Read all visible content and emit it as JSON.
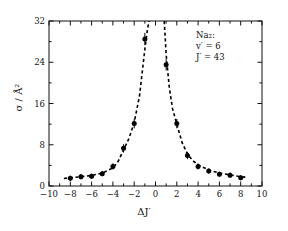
{
  "figure": {
    "annotation": {
      "species": "Na₂:",
      "vibrational": "v′ = 6",
      "rotational": "J′ = 43"
    },
    "axis_titles": {
      "x": "ΔJ′",
      "y": "σ / Å²"
    }
  },
  "chart_data": {
    "type": "scatter",
    "title": "",
    "subtitle": "",
    "xlabel": "ΔJ′",
    "ylabel": "σ / Å²",
    "xlim": [
      -10,
      10
    ],
    "ylim": [
      0,
      32
    ],
    "xticks": [
      -10,
      -8,
      -6,
      -4,
      -2,
      0,
      2,
      4,
      6,
      8,
      10
    ],
    "xtick_labels": [
      "-10",
      "-8",
      "-6",
      "-4",
      "-2",
      "0",
      "2",
      "4",
      "6",
      "8",
      "10"
    ],
    "yticks": [
      0,
      8,
      16,
      24,
      32
    ],
    "ytick_labels": [
      "0",
      "8",
      "16",
      "24",
      "32"
    ],
    "minor_xticks": [
      -9,
      -7,
      -5,
      -3,
      -1,
      1,
      3,
      5,
      7,
      9
    ],
    "minor_yticks": [
      4,
      12,
      20,
      28
    ],
    "grid": false,
    "legend": null,
    "ticks_direction": "in",
    "frame": "box",
    "marker": "filled-circle",
    "marker_color": "#000000",
    "errorbars": true,
    "series": [
      {
        "name": "cross section",
        "x": [
          -8,
          -7,
          -6,
          -5,
          -4,
          -3,
          -2,
          -1,
          1,
          2,
          3,
          4,
          5,
          6,
          7,
          8
        ],
        "y": [
          1.5,
          1.8,
          1.9,
          2.4,
          3.8,
          7.3,
          12.1,
          28.5,
          23.5,
          12.1,
          5.9,
          3.8,
          2.9,
          2.3,
          2.1,
          1.6
        ],
        "yerr": [
          0.5,
          0.5,
          0.5,
          0.5,
          0.6,
          0.8,
          0.9,
          1.2,
          1.1,
          0.9,
          0.7,
          0.6,
          0.5,
          0.5,
          0.5,
          0.5
        ]
      }
    ],
    "fit_curves": [
      {
        "name": "left-branch-fit",
        "style": "dashed",
        "color": "#000000",
        "x": [
          -8.6,
          -8,
          -7,
          -6,
          -5,
          -4,
          -3.5,
          -3,
          -2.5,
          -2,
          -1.5,
          -1,
          -0.75,
          -0.6
        ],
        "y": [
          1.45,
          1.6,
          1.8,
          2.05,
          2.5,
          3.5,
          4.8,
          7.0,
          9.2,
          12.3,
          17.5,
          26.5,
          30.5,
          32.0
        ]
      },
      {
        "name": "right-branch-fit",
        "style": "dashed",
        "color": "#000000",
        "x": [
          0.82,
          1,
          1.3,
          1.6,
          2,
          2.5,
          3,
          3.5,
          4,
          5,
          6,
          7,
          8,
          8.6
        ],
        "y": [
          32.0,
          25.5,
          19.0,
          15.0,
          12.0,
          8.4,
          6.2,
          4.9,
          4.1,
          3.1,
          2.5,
          2.15,
          1.8,
          1.7
        ]
      }
    ],
    "annotations": [
      {
        "text": "Na₂:",
        "x": 4.2,
        "y": 28.0
      },
      {
        "text": "v′ = 6",
        "x": 4.2,
        "y": 25.5
      },
      {
        "text": "J′ = 43",
        "x": 4.2,
        "y": 23.0
      }
    ]
  }
}
